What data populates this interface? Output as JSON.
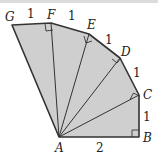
{
  "diagram": {
    "fill_color": "#cfcfcf",
    "stroke_color": "#333333",
    "points": {
      "A": {
        "label": "A",
        "x": 59,
        "y": 137
      },
      "B": {
        "label": "B",
        "x": 139,
        "y": 137
      },
      "C": {
        "label": "C",
        "x": 139,
        "y": 95
      },
      "D": {
        "label": "D",
        "x": 120,
        "y": 58
      },
      "E": {
        "label": "E",
        "x": 89,
        "y": 34
      },
      "F": {
        "label": "F",
        "x": 51,
        "y": 23
      },
      "G": {
        "label": "G",
        "x": 12,
        "y": 25
      }
    },
    "segment_labels": {
      "AB": "2",
      "BC": "1",
      "CD": "1",
      "DE": "1",
      "EF": "1",
      "FG": "1"
    }
  }
}
